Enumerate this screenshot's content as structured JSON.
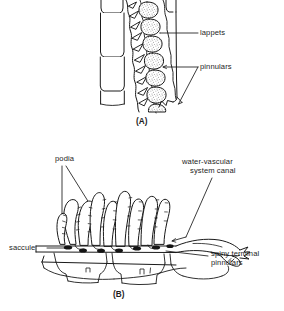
{
  "figure": {
    "type": "scientific-line-drawing",
    "background_color": "#ffffff",
    "ink_color": "#1a1a1a",
    "panels": [
      {
        "tag": "(A)",
        "subject": "pinnule-with-lappets-and-pinnulars",
        "labels": [
          {
            "name": "lappets",
            "text": "lappets"
          },
          {
            "name": "pinnulars",
            "text": "pinnulars"
          }
        ]
      },
      {
        "tag": "(B)",
        "subject": "pinnule-cross-section-podia-water-vascular-canal",
        "labels": [
          {
            "name": "podia",
            "text": "podia"
          },
          {
            "name": "water-vascular-system-canal",
            "line1": "water-vascular",
            "line2": "system canal"
          },
          {
            "name": "saccule",
            "text": "saccule"
          },
          {
            "name": "spiny-terminal-pinnulars",
            "line1": "spiny terminal",
            "line2": "pinnulars"
          }
        ]
      }
    ]
  },
  "panel_a": {
    "tag": "(A)",
    "label_lappets": "lappets",
    "label_pinnulars": "pinnulars"
  },
  "panel_b": {
    "tag": "(B)",
    "label_podia": "podia",
    "label_wvsc_line1": "water-vascular",
    "label_wvsc_line2": "system canal",
    "label_saccule": "saccule",
    "label_spiny_line1": "spiny terminal",
    "label_spiny_line2": "pinnulars"
  },
  "caption": {
    "cut_off_text": ""
  }
}
